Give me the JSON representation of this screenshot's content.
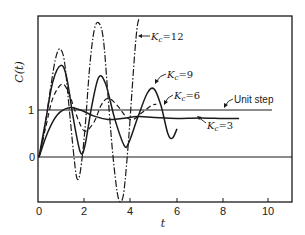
{
  "chart_data": {
    "type": "line",
    "title": "",
    "xlabel": "t",
    "ylabel": "C(t)",
    "xlim": [
      0,
      11.2
    ],
    "ylim": [
      -0.95,
      3.0
    ],
    "grid": false,
    "x_ticks": [
      "0",
      "2",
      "4",
      "6",
      "8",
      "10"
    ],
    "y_ticks": [
      "0",
      "1"
    ],
    "reference_lines": [
      {
        "name": "Unit step",
        "y": 1,
        "x_range": [
          0,
          10.1
        ]
      },
      {
        "name": "Zero line",
        "y": 0,
        "x_range": [
          0,
          11.2
        ]
      }
    ],
    "series": [
      {
        "name": "Kc=12",
        "style": "dash-dot",
        "points": [
          [
            0,
            0
          ],
          [
            0.2,
            0.45
          ],
          [
            0.45,
            1.3
          ],
          [
            0.7,
            2.05
          ],
          [
            0.9,
            2.3
          ],
          [
            1.1,
            2.05
          ],
          [
            1.3,
            1.1
          ],
          [
            1.5,
            0.1
          ],
          [
            1.65,
            -0.45
          ],
          [
            1.8,
            -0.3
          ],
          [
            2.0,
            0.6
          ],
          [
            2.2,
            1.9
          ],
          [
            2.4,
            2.7
          ],
          [
            2.6,
            2.85
          ],
          [
            2.8,
            2.5
          ],
          [
            3.0,
            1.3
          ],
          [
            3.2,
            0.1
          ],
          [
            3.4,
            -0.75
          ],
          [
            3.55,
            -0.95
          ],
          [
            3.7,
            -0.7
          ],
          [
            3.9,
            0.4
          ],
          [
            4.1,
            1.8
          ],
          [
            4.25,
            2.7
          ],
          [
            4.35,
            2.95
          ]
        ]
      },
      {
        "name": "Kc=9",
        "style": "solid",
        "points": [
          [
            0,
            0
          ],
          [
            0.3,
            0.8
          ],
          [
            0.6,
            1.6
          ],
          [
            0.95,
            1.95
          ],
          [
            1.2,
            1.7
          ],
          [
            1.5,
            0.8
          ],
          [
            1.8,
            0.1
          ],
          [
            2.0,
            0.25
          ],
          [
            2.3,
            1.1
          ],
          [
            2.6,
            1.7
          ],
          [
            2.9,
            1.55
          ],
          [
            3.3,
            0.8
          ],
          [
            3.7,
            0.25
          ],
          [
            3.9,
            0.3
          ],
          [
            4.3,
            0.85
          ],
          [
            4.7,
            1.35
          ],
          [
            5.0,
            1.45
          ],
          [
            5.3,
            1.1
          ],
          [
            5.6,
            0.5
          ],
          [
            5.8,
            0.4
          ],
          [
            6.0,
            0.6
          ]
        ]
      },
      {
        "name": "Kc=6",
        "style": "dashed",
        "points": [
          [
            0,
            0
          ],
          [
            0.3,
            0.65
          ],
          [
            0.6,
            1.25
          ],
          [
            1.0,
            1.55
          ],
          [
            1.3,
            1.35
          ],
          [
            1.7,
            0.8
          ],
          [
            2.0,
            0.55
          ],
          [
            2.4,
            0.75
          ],
          [
            2.7,
            1.1
          ],
          [
            3.0,
            1.25
          ],
          [
            3.4,
            1.1
          ],
          [
            3.8,
            0.85
          ],
          [
            4.1,
            0.8
          ],
          [
            4.5,
            0.95
          ],
          [
            4.9,
            1.1
          ],
          [
            5.1,
            1.12
          ]
        ]
      },
      {
        "name": "Kc=3",
        "style": "solid",
        "points": [
          [
            0,
            0
          ],
          [
            0.4,
            0.55
          ],
          [
            0.8,
            0.9
          ],
          [
            1.3,
            1.05
          ],
          [
            1.8,
            1.0
          ],
          [
            2.4,
            0.87
          ],
          [
            3.0,
            0.8
          ],
          [
            3.6,
            0.82
          ],
          [
            4.3,
            0.86
          ],
          [
            5.0,
            0.84
          ],
          [
            6.0,
            0.82
          ],
          [
            7.0,
            0.83
          ],
          [
            8.0,
            0.82
          ],
          [
            8.7,
            0.82
          ]
        ]
      }
    ],
    "annotations": [
      {
        "text_k": "K",
        "text_sub": "c",
        "text_val": "=12",
        "x": 4.45,
        "y": 2.65
      },
      {
        "text_k": "K",
        "text_sub": "c",
        "text_val": "=9",
        "x": 5.5,
        "y": 1.85
      },
      {
        "text_k": "K",
        "text_sub": "c",
        "text_val": "=6",
        "x": 5.6,
        "y": 1.35
      },
      {
        "text": "Unit step",
        "x": 7.7,
        "y": 1.12
      },
      {
        "text_k": "K",
        "text_sub": "c",
        "text_val": "=3",
        "x": 7.4,
        "y": 0.58
      }
    ]
  },
  "labels": {
    "ylabel_text": "C(t)",
    "xlabel_text": "t",
    "y_tick_0": "0",
    "y_tick_1": "1",
    "x_tick_0": "0",
    "x_tick_2": "2",
    "x_tick_4": "4",
    "x_tick_6": "6",
    "x_tick_8": "8",
    "x_tick_10": "10",
    "kc12_k": "K",
    "kc12_sub": "c",
    "kc12_val": "=12",
    "kc9_k": "K",
    "kc9_sub": "c",
    "kc9_val": "=9",
    "kc6_k": "K",
    "kc6_sub": "c",
    "kc6_val": "=6",
    "kc3_k": "K",
    "kc3_sub": "c",
    "kc3_val": "=3",
    "unit_step": "Unit step"
  },
  "colors": {
    "ink": "#1a1a1a",
    "background": "#ffffff"
  }
}
